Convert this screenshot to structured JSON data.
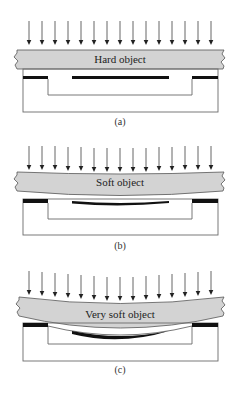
{
  "panels": [
    {
      "id": "a",
      "object_label": "Hard object",
      "caption": "(a)",
      "stiffness": "hard"
    },
    {
      "id": "b",
      "object_label": "Soft object",
      "caption": "(b)",
      "stiffness": "soft"
    },
    {
      "id": "c",
      "object_label": "Very soft object",
      "caption": "(c)",
      "stiffness": "very-soft"
    }
  ],
  "arrow_count": 15,
  "colors": {
    "slab_fill": "#d3d3d3",
    "contact_bar": "#111111",
    "outline": "#6a6a6a"
  }
}
